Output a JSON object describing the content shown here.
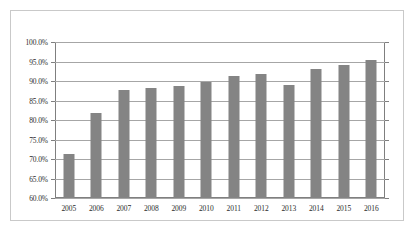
{
  "chart_data": {
    "type": "bar",
    "title": "",
    "subtitle": "",
    "xlabel": "",
    "ylabel": "",
    "categories": [
      "2005",
      "2006",
      "2007",
      "2008",
      "2009",
      "2010",
      "2011",
      "2012",
      "2013",
      "2014",
      "2015",
      "2016"
    ],
    "values": [
      71.3,
      81.8,
      87.8,
      88.2,
      88.6,
      89.7,
      91.2,
      91.8,
      88.9,
      93.1,
      94.0,
      95.5
    ],
    "value_unit": "%",
    "ylim": [
      60.0,
      100.0
    ],
    "ytick_labels": [
      "100.0%",
      "95.0%",
      "90.0%",
      "85.0%",
      "80.0%",
      "75.0%",
      "70.0%",
      "65.0%",
      "60.0%"
    ],
    "ytick_values": [
      100.0,
      95.0,
      90.0,
      85.0,
      80.0,
      75.0,
      70.0,
      65.0,
      60.0
    ],
    "grid": true,
    "legend": false,
    "legend_position": "none",
    "series": [
      {
        "name": "",
        "color": "#848484",
        "values": [
          71.3,
          81.8,
          87.8,
          88.2,
          88.6,
          89.7,
          91.2,
          91.8,
          88.9,
          93.1,
          94.0,
          95.5
        ]
      }
    ],
    "colors": {
      "bar": "#848484",
      "gridline": "#a6a6a6",
      "axis": "#7f7f7f",
      "border": "#c9c9c9",
      "text": "#2b2b2b",
      "background": "#ffffff"
    }
  }
}
